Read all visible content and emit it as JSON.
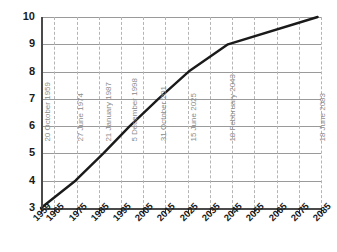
{
  "chart_data": {
    "type": "line",
    "title": "",
    "subtitle": "",
    "xlabel": "",
    "ylabel": "",
    "xlim": [
      1959,
      2085
    ],
    "ylim": [
      3,
      10
    ],
    "grid": true,
    "legend": false,
    "x_tick_labels": [
      "1959",
      "1965",
      "1975",
      "1985",
      "1995",
      "2005",
      "2015",
      "2025",
      "2035",
      "2045",
      "2055",
      "2065",
      "2075",
      "2085"
    ],
    "x_tick_values": [
      1959,
      1965,
      1975,
      1985,
      1995,
      2005,
      2015,
      2025,
      2035,
      2045,
      2055,
      2065,
      2075,
      2085
    ],
    "y_tick_labels": [
      "10",
      "9",
      "8",
      "7",
      "6",
      "5",
      "4",
      "3"
    ],
    "y_tick_values": [
      10,
      9,
      8,
      7,
      6,
      5,
      4,
      3
    ],
    "vertical_gridline_values": [
      1965,
      1975,
      1985,
      1995,
      2005,
      2015,
      2025,
      2035,
      2045,
      2055,
      2065,
      2075,
      2085
    ],
    "series": [
      {
        "name": "",
        "x": [
          1959,
          1974.49,
          1987.06,
          1998.93,
          2011.83,
          2025.45,
          2043.13,
          2083.46
        ],
        "values": [
          3,
          4,
          5,
          6,
          7,
          8,
          9,
          10
        ]
      }
    ],
    "annotations": [
      {
        "label": "20 October 1959",
        "x": 1959.8,
        "y": 3
      },
      {
        "label": "27 June 1974",
        "x": 1974.49,
        "y": 4
      },
      {
        "label": "21 January 1987",
        "x": 1987.06,
        "y": 5
      },
      {
        "label": "5 December 1998",
        "x": 1998.93,
        "y": 6
      },
      {
        "label": "31 October 201",
        "x": 2011.83,
        "y": 7
      },
      {
        "label": "15 June 2025",
        "x": 2025.45,
        "y": 8
      },
      {
        "label": "18 Febbruary 2043",
        "x": 2043.13,
        "y": 9
      },
      {
        "label": "18 June 2083",
        "x": 2083.46,
        "y": 10
      }
    ],
    "colors": {
      "series_line": "#1a1a1a",
      "horizontal_gridline": "#9a9a9a",
      "vertical_gridline": "#b4b4b4",
      "axis": "#4a4a4a",
      "annotation_text": "#8c8c8c",
      "tick_text": "#1a1a1a",
      "background": "#ffffff"
    }
  }
}
